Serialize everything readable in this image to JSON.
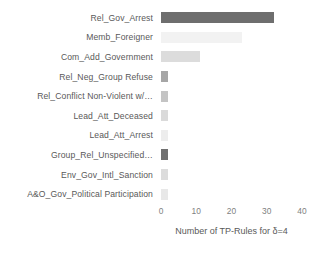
{
  "chart_data": {
    "type": "bar",
    "orientation": "horizontal",
    "title": "",
    "xlabel": "Number of TP-Rules for δ=4",
    "ylabel": "",
    "xlim": [
      0,
      40
    ],
    "xticks": [
      0,
      10,
      20,
      30,
      40
    ],
    "xticklabels": [
      "0",
      "10",
      "20",
      "30",
      "40"
    ],
    "grid": false,
    "legend": null,
    "categories": [
      "Rel_Gov_Arrest",
      "Memb_Foreigner",
      "Com_Add_Government",
      "Rel_Neg_Group Refuse",
      "Rel_Conflict Non-Violent w/…",
      "Lead_Att_Deceased",
      "Lead_Att_Arrest",
      "Group_Rel_Unspecified…",
      "Env_Gov_Intl_Sanction",
      "A&O_Gov_Political Participation"
    ],
    "values": [
      32,
      23,
      11,
      2,
      2,
      2,
      2,
      2,
      2,
      2
    ],
    "bar_colors": [
      "#6e6e6e",
      "#f2f2f2",
      "#dcdcdc",
      "#a6a6a6",
      "#c4c4c4",
      "#dadada",
      "#ededed",
      "#707070",
      "#dcdcdc",
      "#e8e8e8"
    ]
  },
  "axis": {
    "tick_color": "#7f7f7f",
    "label_color": "#595959"
  }
}
